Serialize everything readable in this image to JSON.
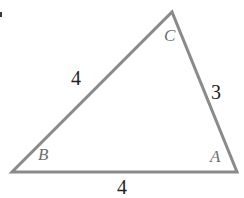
{
  "figure": {
    "kind": "triangle-diagram",
    "background_color": "#ffffff",
    "stroke_color": "#8a8a8a",
    "stroke_width": 3,
    "vertex_label_color": "#6e6e6e",
    "side_label_color": "#232323",
    "width": 244,
    "height": 198
  },
  "vertices": [
    {
      "name": "A",
      "label": "A",
      "x": 237,
      "y": 172
    },
    {
      "name": "B",
      "label": "B",
      "x": 12,
      "y": 172
    },
    {
      "name": "C",
      "label": "C",
      "x": 172,
      "y": 12
    }
  ],
  "sides": [
    {
      "name": "AB",
      "label": "4",
      "from": "A",
      "to": "B"
    },
    {
      "name": "BC",
      "label": "4",
      "from": "B",
      "to": "C"
    },
    {
      "name": "AC",
      "label": "3",
      "from": "A",
      "to": "C"
    }
  ],
  "chart_data": {
    "type": "diagram",
    "title": "",
    "shape": "triangle",
    "vertex_labels": [
      "A",
      "B",
      "C"
    ],
    "vertex_points": [
      [
        237,
        172
      ],
      [
        12,
        172
      ],
      [
        172,
        12
      ]
    ],
    "side_labels": [
      "4",
      "4",
      "3"
    ],
    "side_label_map": {
      "AB": "4",
      "BC": "4",
      "AC": "3"
    }
  },
  "artifact": {
    "name": "edge-speck",
    "x": 0,
    "y": 12
  }
}
